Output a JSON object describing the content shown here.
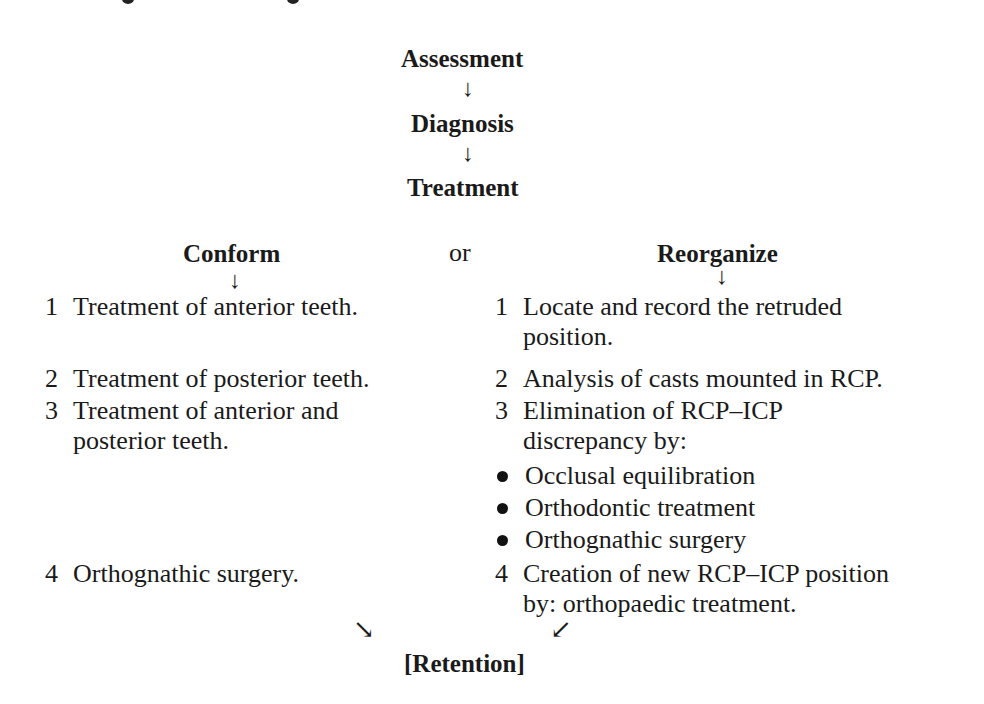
{
  "flow": {
    "steps": [
      "Assessment",
      "Diagnosis",
      "Treatment"
    ],
    "arrow_down": "↓"
  },
  "branches": {
    "connector": "or",
    "conform": {
      "title": "Conform",
      "items": [
        {
          "num": "1",
          "lines": [
            "Treatment of anterior teeth."
          ]
        },
        {
          "num": "2",
          "lines": [
            "Treatment of posterior teeth."
          ]
        },
        {
          "num": "3",
          "lines": [
            "Treatment of anterior and",
            "posterior teeth."
          ]
        },
        {
          "num": "4",
          "lines": [
            "Orthognathic surgery."
          ]
        }
      ]
    },
    "reorganize": {
      "title": "Reorganize",
      "items": [
        {
          "num": "1",
          "lines": [
            "Locate and record the retruded",
            "position."
          ]
        },
        {
          "num": "2",
          "lines": [
            "Analysis of casts mounted in RCP."
          ]
        },
        {
          "num": "3",
          "lines": [
            "Elimination of RCP–ICP",
            "discrepancy by:"
          ]
        },
        {
          "num": "4",
          "lines": [
            "Creation of new RCP–ICP position",
            "by: orthopaedic treatment."
          ]
        }
      ],
      "sub_bullets": [
        "Occlusal equilibration",
        "Orthodontic treatment",
        "Orthognathic surgery"
      ]
    }
  },
  "merge": {
    "arrow_left": "↘",
    "arrow_right": "↙",
    "result": "[Retention]"
  }
}
